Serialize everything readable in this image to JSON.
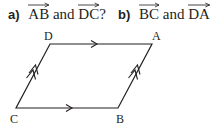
{
  "questions": [
    {
      "label": "a)",
      "vec1": "AB",
      "connector": "and",
      "vec2": "DC",
      "end": "?"
    },
    {
      "label": "b)",
      "vec1": "BC",
      "connector": "and",
      "vec2": "DA",
      "end": "?"
    }
  ],
  "vertices": [
    {
      "name": "D",
      "x": 50,
      "y": 44
    },
    {
      "name": "A",
      "x": 152,
      "y": 44
    },
    {
      "name": "B",
      "x": 118,
      "y": 108
    },
    {
      "name": "C",
      "x": 16,
      "y": 108
    }
  ],
  "stroke_color": "#231f20"
}
